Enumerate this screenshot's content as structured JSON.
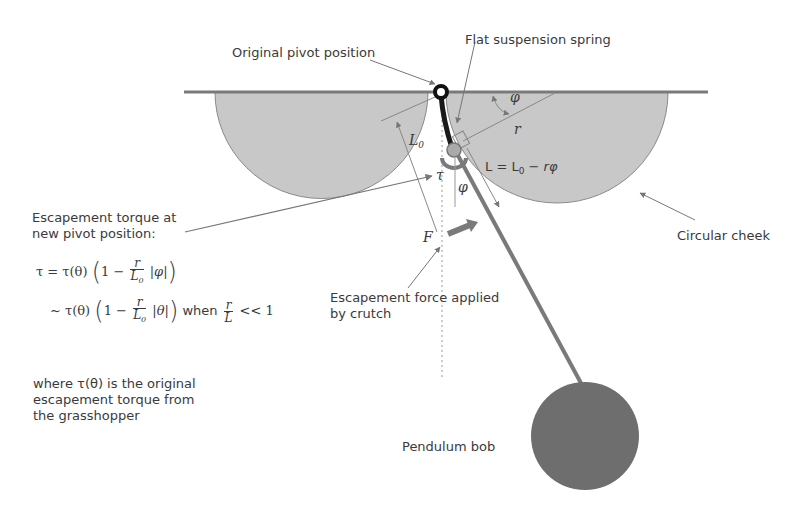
{
  "labels": {
    "original_pivot": "Original pivot position",
    "flat_spring": "Flat suspension spring",
    "circular_cheek": "Circular cheek",
    "escapement_force_line1": "Escapement force applied",
    "escapement_force_line2": "by crutch",
    "pendulum_bob": "Pendulum bob",
    "escapement_torque_line1": "Escapement torque at",
    "escapement_torque_line2": "new pivot position:"
  },
  "symbols": {
    "phi_top": "φ",
    "r": "r",
    "L0": "L",
    "L0_sub": "0",
    "tau": "τ",
    "phi_lower": "φ",
    "F": "F",
    "length_formula": "L = L",
    "length_formula_sub": "0",
    "length_formula_tail": " − rφ"
  },
  "equations": {
    "eq1": {
      "lhs": "τ = τ(θ)",
      "one_minus": "1 −",
      "num": "r",
      "den": "L",
      "den_sub": "0",
      "abs": "|φ|"
    },
    "eq2": {
      "lhs": "~ τ(θ)",
      "one_minus": "1 −",
      "num": "r",
      "den": "L",
      "den_sub": "0",
      "abs": "|θ|",
      "when": "when",
      "cond_num": "r",
      "cond_den": "L",
      "cond_tail": "<< 1"
    }
  },
  "note": {
    "line1": "where τ(θ) is the original",
    "line2": "escapement torque from",
    "line3": "the grasshopper"
  },
  "colors": {
    "cheek_fill": "#c8c8c8",
    "cheek_stroke": "#8a8a8a",
    "rod": "#7a7a7a",
    "bob": "#6e6e6e",
    "leader": "#777777",
    "text": "#3a3a3a"
  }
}
